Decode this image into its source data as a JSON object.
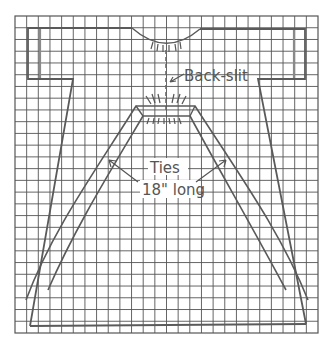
{
  "figure": {
    "type": "sewing-pattern-diagram",
    "grid": {
      "columns": 26,
      "rows": 27
    }
  },
  "labels": {
    "back_slit": "Back-slit",
    "ties_line1": "Ties",
    "ties_line2": "18\" long"
  },
  "colors": {
    "line": "#5a5a5a",
    "grid": "#555555",
    "background": "#ffffff"
  }
}
